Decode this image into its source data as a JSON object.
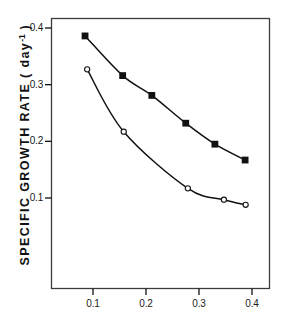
{
  "figure": {
    "background_color": "#ffffff",
    "ink_color": "#111111"
  },
  "chart_data": {
    "type": "line",
    "title": "",
    "xlabel": "",
    "ylabel": "SPECIFIC GROWTH RATE ( day-1 )",
    "ylabel_main": "SPECIFIC  GROWTH  RATE  ( day",
    "ylabel_exponent": "-1",
    "ylabel_tail": " )",
    "xlim": [
      0.0,
      0.43
    ],
    "ylim": [
      0.0,
      0.425
    ],
    "grid": false,
    "legend": "none",
    "xticks": [
      0.1,
      0.2,
      0.3,
      0.4
    ],
    "xtick_labels": [
      "0.1",
      "0.2",
      "0.3",
      "0.4"
    ],
    "yticks": [
      0.1,
      0.2,
      0.3,
      0.4
    ],
    "ytick_labels": [
      "0.1",
      "0.2",
      "0.3",
      "0.4"
    ],
    "series": [
      {
        "name": "upper-curve",
        "marker": "filled-square",
        "marker_size": 3.4,
        "color": "#111111",
        "x": [
          0.085,
          0.156,
          0.211,
          0.275,
          0.33,
          0.387
        ],
        "y": [
          0.386,
          0.316,
          0.281,
          0.232,
          0.195,
          0.167
        ]
      },
      {
        "name": "lower-curve",
        "marker": "open-circle",
        "marker_size": 2.6,
        "color": "#111111",
        "x": [
          0.089,
          0.158,
          0.279,
          0.347,
          0.388
        ],
        "y": [
          0.327,
          0.217,
          0.117,
          0.097,
          0.088
        ]
      }
    ]
  }
}
